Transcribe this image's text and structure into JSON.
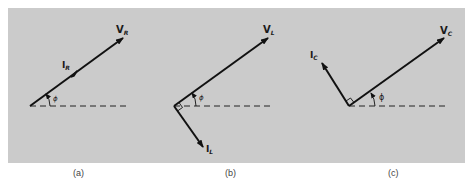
{
  "figure": {
    "background_color": "#cbcbcb",
    "line_color": "#111111",
    "panels": [
      {
        "id": "a",
        "caption": "(a)",
        "voltage": {
          "main": "V",
          "sub": "R"
        },
        "current": {
          "main": "I",
          "sub": "R"
        },
        "angle": "ϕ",
        "relation": "current in phase with voltage"
      },
      {
        "id": "b",
        "caption": "(b)",
        "voltage": {
          "main": "V",
          "sub": "L"
        },
        "current": {
          "main": "I",
          "sub": "L"
        },
        "angle": "ϕ",
        "relation": "current lags voltage by 90°"
      },
      {
        "id": "c",
        "caption": "(c)",
        "voltage": {
          "main": "V",
          "sub": "C"
        },
        "current": {
          "main": "I",
          "sub": "C"
        },
        "angle": "ϕ",
        "relation": "current leads voltage by 90°"
      }
    ]
  }
}
